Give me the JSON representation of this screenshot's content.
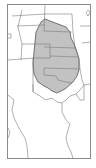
{
  "map": {
    "type": "species-range-map",
    "region": "central United States",
    "colors": {
      "background": "#ffffff",
      "border": "#6e6e6e",
      "range_fill": "#bdbdbd",
      "range_stroke": "#555555"
    },
    "range_label": "distribution range"
  }
}
